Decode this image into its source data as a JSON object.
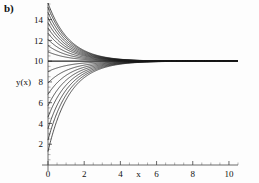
{
  "panel": {
    "label": "b)"
  },
  "chart_data": {
    "type": "line",
    "title": "",
    "subtitle": "",
    "xlabel": "x",
    "ylabel": "y(x)",
    "xlim": [
      0,
      10.5
    ],
    "ylim": [
      0,
      15.6
    ],
    "grid": false,
    "legend": null,
    "legend_position": "none",
    "x_ticks": [
      0,
      2,
      4,
      6,
      8,
      10
    ],
    "x_tick_labels": [
      "0",
      "2",
      "4",
      "6",
      "8",
      "10"
    ],
    "x_minor_tick_step": 0.5,
    "y_ticks": [
      2,
      4,
      6,
      8,
      10,
      12,
      14
    ],
    "y_tick_labels": [
      "2",
      "4",
      "6",
      "8",
      "10",
      "12",
      "14"
    ],
    "y_minor_tick_step": 0.5,
    "xlabel_position_on_axis": 5.0,
    "ylabel_position_on_axis": 8.0,
    "asymptote": 10,
    "annotations": [],
    "model": "y(x) = 10 + (y0 - 10) * exp(-k * x)",
    "decay_rate_k": 0.85,
    "series": [
      {
        "name": "y0=1.3",
        "y0": 1.3,
        "color": "#1b1b1b"
      },
      {
        "name": "y0=2.4",
        "y0": 2.4,
        "color": "#1b1b1b"
      },
      {
        "name": "y0=3.5",
        "y0": 3.5,
        "color": "#1b1b1b"
      },
      {
        "name": "y0=4.6",
        "y0": 4.6,
        "color": "#1b1b1b"
      },
      {
        "name": "y0=5.7",
        "y0": 5.7,
        "color": "#1b1b1b"
      },
      {
        "name": "y0=6.8",
        "y0": 6.8,
        "color": "#1b1b1b"
      },
      {
        "name": "y0=7.9",
        "y0": 7.9,
        "color": "#1b1b1b"
      },
      {
        "name": "y0=9.0",
        "y0": 9.0,
        "color": "#1b1b1b"
      },
      {
        "name": "y0=10.0",
        "y0": 10.0,
        "color": "#1b1b1b"
      },
      {
        "name": "y0=10.9",
        "y0": 10.9,
        "color": "#1b1b1b"
      },
      {
        "name": "y0=11.5",
        "y0": 11.5,
        "color": "#1b1b1b"
      },
      {
        "name": "y0=12.1",
        "y0": 12.1,
        "color": "#1b1b1b"
      },
      {
        "name": "y0=12.7",
        "y0": 12.7,
        "color": "#1b1b1b"
      },
      {
        "name": "y0=13.2",
        "y0": 13.2,
        "color": "#1b1b1b"
      },
      {
        "name": "y0=13.7",
        "y0": 13.7,
        "color": "#1b1b1b"
      },
      {
        "name": "y0=14.2",
        "y0": 14.2,
        "color": "#1b1b1b"
      },
      {
        "name": "y0=14.7",
        "y0": 14.7,
        "color": "#1b1b1b"
      },
      {
        "name": "y0=15.2",
        "y0": 15.2,
        "color": "#1b1b1b"
      },
      {
        "name": "y0=15.6",
        "y0": 15.6,
        "color": "#1b1b1b"
      }
    ]
  }
}
